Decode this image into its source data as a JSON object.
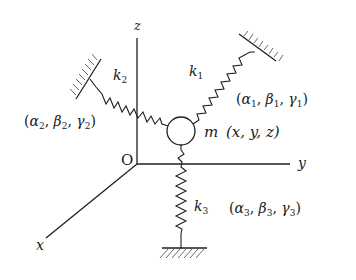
{
  "figure": {
    "type": "spring-mass system in 3D coordinates",
    "axes": {
      "x_label": "x",
      "y_label": "y",
      "z_label": "z",
      "origin_label": "O"
    },
    "mass": {
      "symbol": "m",
      "coords": "(x, y, z)"
    },
    "springs": [
      {
        "id": 1,
        "stiffness_symbol": "k",
        "stiffness_sub": "1",
        "angles": {
          "a": "α",
          "a_sub": "1",
          "b": "β",
          "b_sub": "1",
          "g": "γ",
          "g_sub": "1"
        }
      },
      {
        "id": 2,
        "stiffness_symbol": "k",
        "stiffness_sub": "2",
        "angles": {
          "a": "α",
          "a_sub": "2",
          "b": "β",
          "b_sub": "2",
          "g": "γ",
          "g_sub": "2"
        }
      },
      {
        "id": 3,
        "stiffness_symbol": "k",
        "stiffness_sub": "3",
        "angles": {
          "a": "α",
          "a_sub": "3",
          "b": "β",
          "b_sub": "3",
          "g": "γ",
          "g_sub": "3"
        }
      }
    ],
    "punct": {
      "open": "(",
      "close": ")",
      "comma": ", "
    },
    "colors": {
      "ink": "#1f1f1f",
      "background": "#ffffff"
    }
  }
}
